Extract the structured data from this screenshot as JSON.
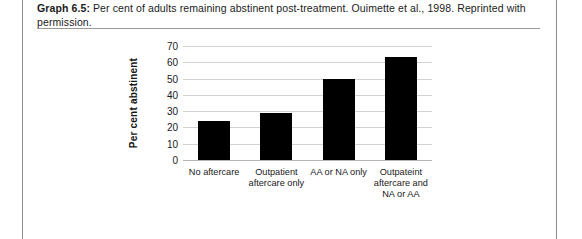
{
  "card": {
    "border_color": "#8c8c8c"
  },
  "caption": {
    "label": "Graph 6.5:",
    "text": " Per cent of adults remaining abstinent post-treatment. Ouimette et al., 1998. Reprinted with permission."
  },
  "chart_data": {
    "type": "bar",
    "title": "",
    "xlabel": "",
    "ylabel": "Per cent abstinent",
    "categories": [
      "No aftercare",
      "Outpatient aftercare only",
      "AA or NA only",
      "Outpateint aftercare and NA or AA"
    ],
    "values": [
      24,
      29,
      50,
      63
    ],
    "ylim": [
      0,
      70
    ],
    "yticks": [
      0,
      10,
      20,
      30,
      40,
      50,
      60,
      70
    ],
    "grid": true,
    "legend": "none",
    "bar_color": "#000000",
    "gridline_color": "#d2d2d2"
  }
}
